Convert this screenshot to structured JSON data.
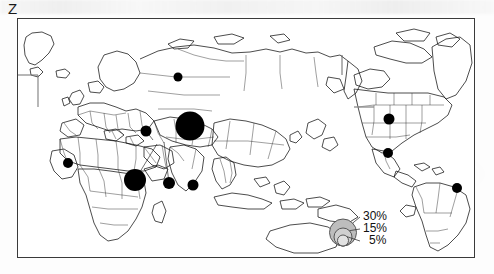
{
  "figure": {
    "panel_label": "Z"
  },
  "legend": {
    "title": "",
    "items": [
      {
        "label": "30%",
        "value": 30
      },
      {
        "label": "15%",
        "value": 15
      },
      {
        "label": "5%",
        "value": 5
      }
    ]
  },
  "chart_data": {
    "type": "scatter",
    "subtype": "proportional-symbol-map",
    "title": "Z",
    "xlabel": "",
    "ylabel": "",
    "units": "percent",
    "projection": "Pacific-centered world map",
    "legend": {
      "position": "bottom-right",
      "values": [
        30,
        15,
        5
      ],
      "labels": [
        "30%",
        "15%",
        "5%"
      ]
    },
    "grid": false,
    "symbol_color": "#000000",
    "series": [
      {
        "name": "Share (%)",
        "points": [
          {
            "label": "Russia",
            "x": 177,
            "y": 76,
            "value": 6,
            "radius_px": 4.5,
            "leader": false
          },
          {
            "label": "India",
            "x": 189,
            "y": 125,
            "value": 30,
            "radius_px": 14.5,
            "leader": false
          },
          {
            "label": "Pakistan",
            "x": 145,
            "y": 130,
            "value": 8,
            "radius_px": 5.5,
            "leader": true,
            "leader_to": {
              "x": 152,
              "y": 139
            }
          },
          {
            "label": "Nigeria",
            "x": 67,
            "y": 162,
            "value": 7,
            "radius_px": 5.0,
            "leader": false
          },
          {
            "label": "Ethiopia",
            "x": 134,
            "y": 179,
            "value": 17,
            "radius_px": 11.0,
            "leader": true,
            "leader_to": {
              "x": 156,
              "y": 143
            }
          },
          {
            "label": "Bangladesh",
            "x": 168,
            "y": 182,
            "value": 9,
            "radius_px": 6.0,
            "leader": true,
            "leader_to": {
              "x": 163,
              "y": 141
            }
          },
          {
            "label": "Indonesia",
            "x": 192,
            "y": 184,
            "value": 8,
            "radius_px": 5.5,
            "leader": false
          },
          {
            "label": "United States",
            "x": 388,
            "y": 118,
            "value": 8,
            "radius_px": 5.5,
            "leader": false
          },
          {
            "label": "Mexico",
            "x": 387,
            "y": 152,
            "value": 7,
            "radius_px": 5.0,
            "leader": false
          },
          {
            "label": "Brazil",
            "x": 456,
            "y": 187,
            "value": 7,
            "radius_px": 5.0,
            "leader": false
          }
        ]
      }
    ]
  }
}
